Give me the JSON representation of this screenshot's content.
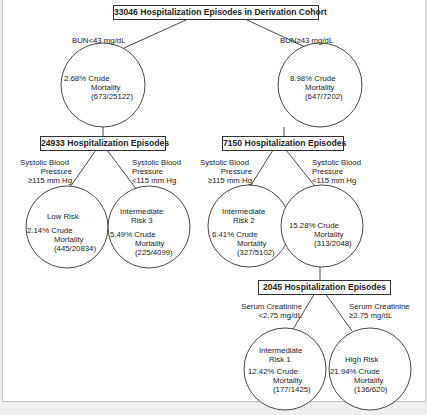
{
  "diagram": {
    "type": "decision-tree",
    "root": {
      "label": "33046 Hospitalization Episodes in Derivation Cohort"
    },
    "level1": {
      "left_split": "BUN<43 mg/dL",
      "right_split": "BUN≥43 mg/dL",
      "left_node": {
        "line1": "2.68% Crude",
        "line2": "Mortality",
        "line3": "(673/25122)"
      },
      "right_node": {
        "line1": "8.98% Crude",
        "line2": "Mortality",
        "line3": "(647/7202)"
      }
    },
    "left_branch": {
      "box": "24933 Hospitalization Episodes",
      "split_left": [
        "Systolic Blood",
        "Pressure",
        "≥115 mm Hg"
      ],
      "split_right": [
        "Systolic Blood",
        "Pressure",
        "<115 mm Hg"
      ],
      "leaf_left": {
        "risk": "Low Risk",
        "risk2": "",
        "line1": "2.14% Crude",
        "line2": "Mortality",
        "line3": "(445/20834)"
      },
      "leaf_right": {
        "risk": "Intermediate",
        "risk2": "Risk 3",
        "line1": "5.49% Crude",
        "line2": "Mortality",
        "line3": "(225/4099)"
      }
    },
    "right_branch": {
      "box": "7150 Hospitalization Episodes",
      "split_left": [
        "Systolic Blood",
        "Pressure",
        "≥115 mm Hg"
      ],
      "split_right": [
        "Systolic Blood",
        "Pressure",
        "<115 mm Hg"
      ],
      "leaf_left": {
        "risk": "Intermediate",
        "risk2": "Risk 2",
        "line1": "6.41% Crude",
        "line2": "Mortality",
        "line3": "(327/5102)"
      },
      "node_right": {
        "line1": "15.28% Crude",
        "line2": "Mortality",
        "line3": "(313/2048)"
      }
    },
    "sub_branch": {
      "box": "2045 Hospitalization Episodes",
      "split_left": [
        "Serum Creatinine",
        "<2.75 mg/dL"
      ],
      "split_right": [
        "Serum Creatinine",
        "≥2.75 mg/dL"
      ],
      "leaf_left": {
        "risk": "Intermediate",
        "risk2": "Risk 1",
        "line1": "12.42% Crude",
        "line2": "Mortality",
        "line3": "(177/1425)"
      },
      "leaf_right": {
        "risk": "High Risk",
        "line1": "21.94% Crude",
        "line2": "Mortality",
        "line3": "(136/620)"
      }
    }
  }
}
